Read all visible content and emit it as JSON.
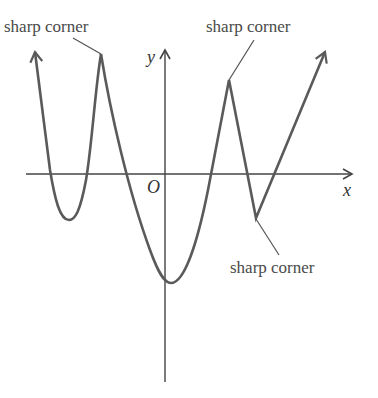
{
  "diagram": {
    "axes": {
      "x_label": "x",
      "y_label": "y",
      "origin_label": "O"
    },
    "annotations": [
      {
        "id": "top-left",
        "text": "sharp corner"
      },
      {
        "id": "top-right",
        "text": "sharp corner"
      },
      {
        "id": "bottom-right",
        "text": "sharp corner"
      }
    ],
    "colors": {
      "curve": "#5a5a5a",
      "axis": "#444444",
      "text": "#4a4a4a"
    }
  }
}
